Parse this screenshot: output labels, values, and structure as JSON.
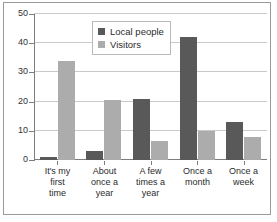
{
  "chart_data": {
    "type": "bar",
    "title": "",
    "subtitle": "",
    "xlabel": "",
    "ylabel": "",
    "categories": [
      "It's my\nfirst\ntime",
      "About\nonce a\nyear",
      "A few\ntimes a\nyear",
      "Once a\nmonth",
      "Once a\nweek"
    ],
    "series": [
      {
        "name": "Local people",
        "color": "#595959",
        "values": [
          1,
          3,
          21,
          42,
          13
        ]
      },
      {
        "name": "Visitors",
        "color": "#acacac",
        "values": [
          34,
          20.5,
          6.5,
          10,
          8
        ]
      }
    ],
    "ylim": [
      0,
      50
    ],
    "yticks": [
      0,
      10,
      20,
      30,
      40,
      50
    ],
    "ytick_labels": [
      "0",
      "10",
      "20",
      "30",
      "40",
      "50"
    ],
    "grid": true,
    "grid_axis": "y",
    "legend_position": "top-center",
    "frame": true
  },
  "legend": {
    "items": [
      {
        "label": "Local people",
        "color": "#595959"
      },
      {
        "label": "Visitors",
        "color": "#acacac"
      }
    ]
  },
  "colors": {
    "local_people": "#595959",
    "visitors": "#acacac",
    "gridline": "#c9c9c9",
    "axis": "#7d7d7d",
    "frame": "#9a9a9a",
    "text": "#2b2b2b",
    "background": "#ffffff"
  }
}
